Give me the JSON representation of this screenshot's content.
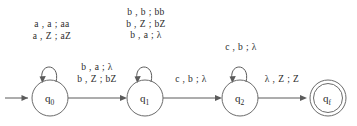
{
  "figure": {
    "stroke_color": "#5b5b5b",
    "text_color": "#2b2b2b",
    "background_color": "#ffffff"
  },
  "states": [
    {
      "id": "q0",
      "label": "q",
      "subscript": "0",
      "accepting": false,
      "start": true,
      "cx": 50,
      "cy": 98,
      "r": 18
    },
    {
      "id": "q1",
      "label": "q",
      "subscript": "1",
      "accepting": false,
      "start": false,
      "cx": 145,
      "cy": 98,
      "r": 18
    },
    {
      "id": "q2",
      "label": "q",
      "subscript": "2",
      "accepting": false,
      "start": false,
      "cx": 240,
      "cy": 98,
      "r": 18
    },
    {
      "id": "qf",
      "label": "q",
      "subscript": "f",
      "accepting": true,
      "start": false,
      "cx": 328,
      "cy": 98,
      "r": 18
    }
  ],
  "self_loops": [
    {
      "state": "q0",
      "lines": [
        "a , a ; aa",
        "a , Z ; aZ"
      ]
    },
    {
      "state": "q1",
      "lines": [
        "b , b ; bb",
        "b , Z ; bZ",
        "b , a ; λ"
      ]
    },
    {
      "state": "q2",
      "lines": [
        "c , b ; λ"
      ]
    }
  ],
  "transitions": [
    {
      "from": "q0",
      "to": "q1",
      "lines": [
        "b , a ; λ",
        "b , Z ; bZ"
      ]
    },
    {
      "from": "q1",
      "to": "q2",
      "lines": [
        "c , b ; λ"
      ]
    },
    {
      "from": "q2",
      "to": "qf",
      "lines": [
        "λ , Z ; Z"
      ]
    }
  ],
  "start_marker": {
    "target": "q0",
    "label": ""
  }
}
